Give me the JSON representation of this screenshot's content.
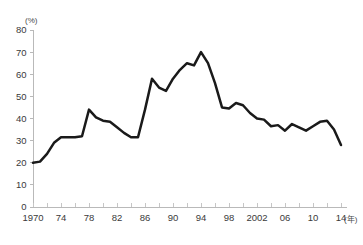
{
  "chart_data": {
    "type": "line",
    "title": "",
    "subtitle": "",
    "xlabel": "(年)",
    "ylabel": "(%)",
    "xlim": [
      1970,
      2014
    ],
    "ylim": [
      0,
      80
    ],
    "grid": false,
    "legend": null,
    "y_ticks": [
      0,
      10,
      20,
      30,
      40,
      50,
      60,
      70,
      80
    ],
    "y_tick_labels": [
      "0",
      "10",
      "20",
      "30",
      "40",
      "50",
      "60",
      "70",
      "80"
    ],
    "x_ticks": [
      1970,
      1974,
      1978,
      1982,
      1986,
      1990,
      1994,
      1998,
      2002,
      2006,
      2010,
      2014
    ],
    "x_tick_labels": [
      "1970",
      "74",
      "78",
      "82",
      "86",
      "90",
      "94",
      "98",
      "2002",
      "06",
      "10",
      "14"
    ],
    "x_minor_tick_step": 2,
    "line_color": "#1a1a1a",
    "series": [
      {
        "name": "",
        "x": [
          1970,
          1971,
          1972,
          1973,
          1974,
          1975,
          1976,
          1977,
          1978,
          1979,
          1980,
          1981,
          1982,
          1983,
          1984,
          1985,
          1986,
          1987,
          1988,
          1989,
          1990,
          1991,
          1992,
          1993,
          1994,
          1995,
          1996,
          1997,
          1998,
          1999,
          2000,
          2001,
          2002,
          2003,
          2004,
          2005,
          2006,
          2007,
          2008,
          2009,
          2010,
          2011,
          2012,
          2013,
          2014
        ],
        "values": [
          20,
          20.5,
          24,
          29,
          31.5,
          31.5,
          31.5,
          32,
          44,
          40.5,
          39,
          38.5,
          36,
          33.5,
          31.5,
          31.5,
          44,
          58,
          54,
          52.5,
          58,
          62,
          65,
          64,
          70,
          65,
          56,
          45,
          44.5,
          47,
          46,
          42.5,
          40,
          39.5,
          36.5,
          37,
          34.5,
          37.5,
          36,
          34.5,
          36.5,
          38.5,
          39,
          35,
          28
        ]
      }
    ]
  },
  "axis": {
    "y_unit": "(%)",
    "x_unit": "(年)"
  }
}
